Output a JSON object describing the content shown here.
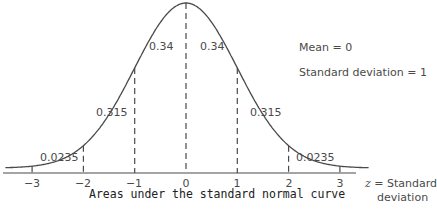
{
  "chart_data": {
    "type": "area",
    "title": "Areas under the standard normal curve",
    "xlabel": "z = Standard deviation",
    "ylabel": "",
    "x_ticks": [
      "-3",
      "-2",
      "-1",
      "0",
      "1",
      "2",
      "3"
    ],
    "xlim": [
      -3.6,
      3.6
    ],
    "grid": false,
    "legend": {
      "position": "upper-right",
      "entries": [
        "Mean = 0",
        "Standard deviation = 1"
      ]
    },
    "regions": [
      {
        "from": "-3",
        "to": "-2",
        "area": "0.0235"
      },
      {
        "from": "-2",
        "to": "-1",
        "area": "0.315"
      },
      {
        "from": "-1",
        "to": "0",
        "area": "0.34"
      },
      {
        "from": "0",
        "to": "1",
        "area": "0.34"
      },
      {
        "from": "1",
        "to": "2",
        "area": "0.315"
      },
      {
        "from": "2",
        "to": "3",
        "area": "0.0235"
      }
    ],
    "mean": 0,
    "standard_deviation": 1
  },
  "labels": {
    "areas": [
      "0.0235",
      "0.315",
      "0.34",
      "0.34",
      "0.315",
      "0.0235"
    ],
    "ticks": [
      "−3",
      "−2",
      "−1",
      "0",
      "1",
      "2",
      "3"
    ],
    "legend_mean": "Mean = 0",
    "legend_sd": "Standard deviation = 1",
    "z_symbol": "z",
    "z_eq": " = Standard",
    "z_line2": "deviation",
    "caption": "Areas under the standard normal curve"
  },
  "colors": {
    "line": "#4a4a4a",
    "text": "#4a4a4a",
    "background": "#ffffff"
  }
}
